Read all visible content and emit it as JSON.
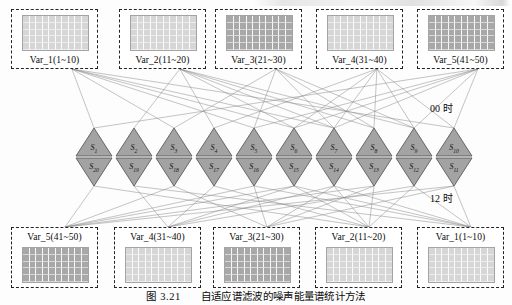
{
  "figure": {
    "caption_number": "图 3.21",
    "caption_text": "自适应谱滤波的噪声能量谱统计方法"
  },
  "annotations": {
    "hour_top": "00 时",
    "hour_bottom": "12 时"
  },
  "top_row": {
    "boxes": [
      {
        "label": "Var_1(1~10)",
        "shade": "light",
        "x": 11,
        "y": 9,
        "w": 87,
        "h": 60
      },
      {
        "label": "Var_2(11~20)",
        "shade": "light",
        "x": 119,
        "y": 9,
        "w": 87,
        "h": 60
      },
      {
        "label": "Var_3(21~30)",
        "shade": "dark",
        "x": 215,
        "y": 9,
        "w": 87,
        "h": 60
      },
      {
        "label": "Var_4(31~40)",
        "shade": "light",
        "x": 316,
        "y": 9,
        "w": 87,
        "h": 60
      },
      {
        "label": "Var_5(41~50)",
        "shade": "dark",
        "x": 417,
        "y": 9,
        "w": 87,
        "h": 60
      }
    ]
  },
  "bottom_row": {
    "boxes": [
      {
        "label": "Var_5(41~50)",
        "shade": "dark",
        "x": 11,
        "y": 227,
        "w": 87,
        "h": 61
      },
      {
        "label": "Var_4(31~40)",
        "shade": "light",
        "x": 114,
        "y": 227,
        "w": 87,
        "h": 61
      },
      {
        "label": "Var_3(21~30)",
        "shade": "dark",
        "x": 213,
        "y": 227,
        "w": 87,
        "h": 61
      },
      {
        "label": "Var_2(11~20)",
        "shade": "light",
        "x": 315,
        "y": 227,
        "w": 87,
        "h": 61
      },
      {
        "label": "Var_1(1~10)",
        "shade": "light",
        "x": 417,
        "y": 227,
        "w": 87,
        "h": 61
      }
    ]
  },
  "triangles": {
    "up_row": [
      {
        "label": "S",
        "sub": "1"
      },
      {
        "label": "S",
        "sub": "2"
      },
      {
        "label": "S",
        "sub": "3"
      },
      {
        "label": "S",
        "sub": "4"
      },
      {
        "label": "S",
        "sub": "5"
      },
      {
        "label": "S",
        "sub": "6"
      },
      {
        "label": "S",
        "sub": "7"
      },
      {
        "label": "S",
        "sub": "8"
      },
      {
        "label": "S",
        "sub": "9"
      },
      {
        "label": "S",
        "sub": "10"
      }
    ],
    "down_row": [
      {
        "label": "S",
        "sub": "20"
      },
      {
        "label": "S",
        "sub": "19"
      },
      {
        "label": "S",
        "sub": "18"
      },
      {
        "label": "S",
        "sub": "17"
      },
      {
        "label": "S",
        "sub": "16"
      },
      {
        "label": "S",
        "sub": "15"
      },
      {
        "label": "S",
        "sub": "14"
      },
      {
        "label": "S",
        "sub": "13"
      },
      {
        "label": "S",
        "sub": "12"
      },
      {
        "label": "S",
        "sub": "11"
      }
    ]
  },
  "colors": {
    "fill_light": "#d6d6d6",
    "fill_dark": "#a8a8a8",
    "triangle_fill": "#a3a3a3",
    "triangle_stroke": "#5a5a5a",
    "edge_stroke": "#8a8a8a",
    "box_border": "#222222",
    "text": "#0a0a0a"
  },
  "layout": {
    "grid_cols": 10,
    "grid_rows": 5,
    "triangle_count_per_row": 10,
    "up_row_top": 128,
    "up_row_bottom": 156,
    "down_row_top": 158,
    "down_row_bottom": 186,
    "tri_left": 76,
    "tri_width": 36
  }
}
